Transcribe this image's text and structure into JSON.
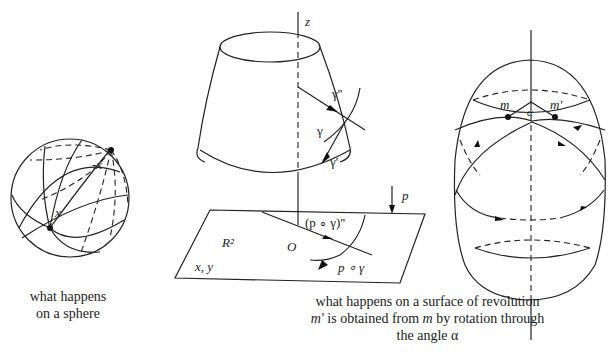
{
  "sphere": {
    "label_x": "x",
    "label_neg_x": "-x",
    "caption_line1": "what happens",
    "caption_line2": "on a sphere"
  },
  "cone": {
    "axis_label": "z",
    "gamma_dd": "γ''",
    "gamma": "γ",
    "gamma_d": "γ'",
    "projection_label": "p",
    "plane_label": "R²",
    "plane_coords": "x, y",
    "origin_label": "O",
    "proj_dd": "(p ∘ γ)''",
    "proj": "p ∘ γ"
  },
  "egg": {
    "label_m": "m",
    "label_m_prime": "m'",
    "label_alpha": "α"
  },
  "caption_main": {
    "line1": "what happens on a surface of revolution",
    "line2_m_prime": "m′",
    "line2_mid": " is obtained from ",
    "line2_m": "m",
    "line2_end": " by rotation through",
    "line3": "the angle α"
  }
}
